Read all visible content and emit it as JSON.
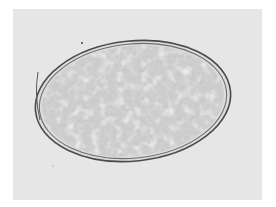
{
  "image": {
    "subject": "oval egg micrograph",
    "style": "grayscale brightfield microscopy",
    "colors": {
      "page_background": "#ffffff",
      "field_background": "#e6e6e6",
      "shell_outer": "#4a4a4a",
      "shell_inner": "#6e6e6e",
      "contents_base": "#cfcfcf",
      "contents_granule_dark": "#9a9a9a",
      "contents_granule_light": "#f0f0f0"
    }
  }
}
